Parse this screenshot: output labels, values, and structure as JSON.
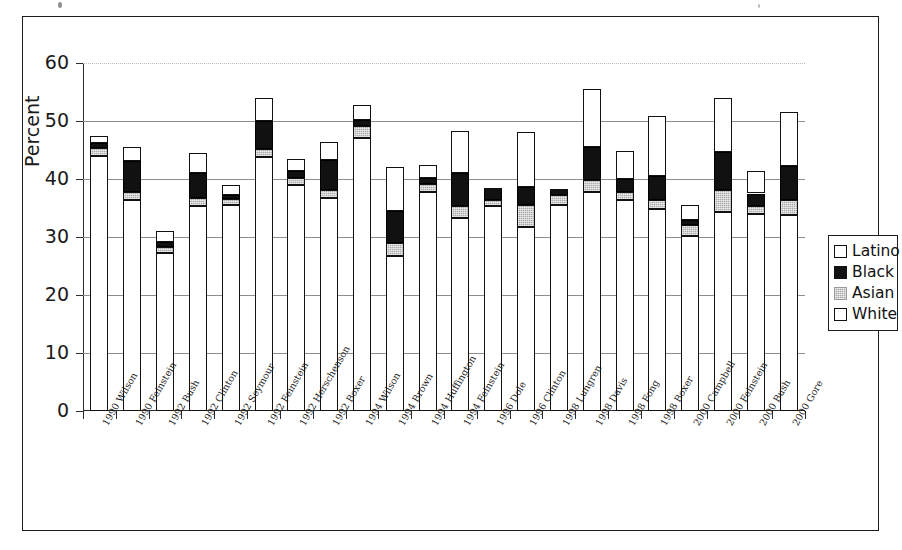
{
  "figure": {
    "frame_color": "#1c1c1c",
    "background": "#ffffff"
  },
  "axes": {
    "y_title": "Percent",
    "y_ticks": [
      "0",
      "10",
      "20",
      "30",
      "40",
      "50",
      "60"
    ],
    "y_min": 0,
    "y_max": 60
  },
  "legend": {
    "position": "right-middle",
    "items": [
      {
        "label": "Latino",
        "swatch": "swatch-open-white",
        "color": "#ffffff"
      },
      {
        "label": "Black",
        "swatch": "swatch-solid-black",
        "color": "#111111"
      },
      {
        "label": "Asian",
        "swatch": "swatch-gray-hatch",
        "color": "#a9a9a9"
      },
      {
        "label": "White",
        "swatch": "swatch-open-white",
        "color": "#ffffff"
      }
    ]
  },
  "chart_data": {
    "type": "bar",
    "title": "",
    "subtitle": "",
    "xlabel": "",
    "ylabel": "Percent",
    "ylim": [
      0,
      60
    ],
    "grid": true,
    "stacked": true,
    "legend_position": "right",
    "categories": [
      "1990 Wilson",
      "1990 Feinstein",
      "1992 Bush",
      "1992 Clinton",
      "1992 Seymour",
      "1992 Feinstein",
      "1992 Herschenson",
      "1992 Boxer",
      "1994 Wilson",
      "1994 Brown",
      "1994 Huffington",
      "1994 Feinstein",
      "1996 Dole",
      "1996 Clinton",
      "1998 Lungren",
      "1998 Davis",
      "1998 Fong",
      "1998 Boxer",
      "2000 Campbell",
      "2000 Feinstein",
      "2000 Bush",
      "2000 Gore"
    ],
    "series": [
      {
        "name": "White",
        "values": [
          44.0,
          36.3,
          27.2,
          35.3,
          35.5,
          43.8,
          39.0,
          36.8,
          47.0,
          26.8,
          37.8,
          33.2,
          35.3,
          31.7,
          35.6,
          37.7,
          36.3,
          34.8,
          30.2,
          34.3,
          34.0,
          33.8
        ]
      },
      {
        "name": "Asian",
        "values": [
          1.3,
          1.5,
          1.1,
          1.4,
          1.0,
          1.4,
          1.2,
          1.3,
          2.2,
          2.1,
          1.4,
          2.2,
          1.1,
          3.8,
          1.6,
          2.1,
          1.4,
          1.6,
          1.9,
          3.8,
          1.4,
          2.6
        ]
      },
      {
        "name": "Black",
        "values": [
          0.9,
          5.3,
          0.9,
          4.4,
          0.7,
          4.8,
          1.1,
          5.1,
          1.0,
          5.6,
          1.0,
          5.6,
          1.9,
          3.2,
          0.9,
          5.7,
          2.3,
          4.1,
          0.9,
          6.6,
          2.1,
          5.9
        ]
      },
      {
        "name": "Latino",
        "values": [
          1.2,
          2.5,
          1.8,
          3.4,
          1.7,
          4.0,
          2.1,
          3.2,
          2.5,
          7.5,
          2.2,
          7.2,
          0.2,
          9.4,
          0.1,
          10.0,
          4.8,
          10.4,
          2.5,
          9.3,
          3.9,
          9.2
        ]
      }
    ],
    "stack_order_bottom_to_top": [
      "White",
      "Asian",
      "Black",
      "Latino"
    ],
    "totals": [
      47.4,
      45.6,
      31.0,
      44.5,
      38.9,
      54.0,
      43.4,
      46.4,
      52.7,
      42.0,
      42.4,
      48.2,
      38.5,
      48.1,
      38.2,
      55.5,
      44.8,
      50.9,
      35.5,
      54.0,
      41.4,
      51.5
    ]
  }
}
